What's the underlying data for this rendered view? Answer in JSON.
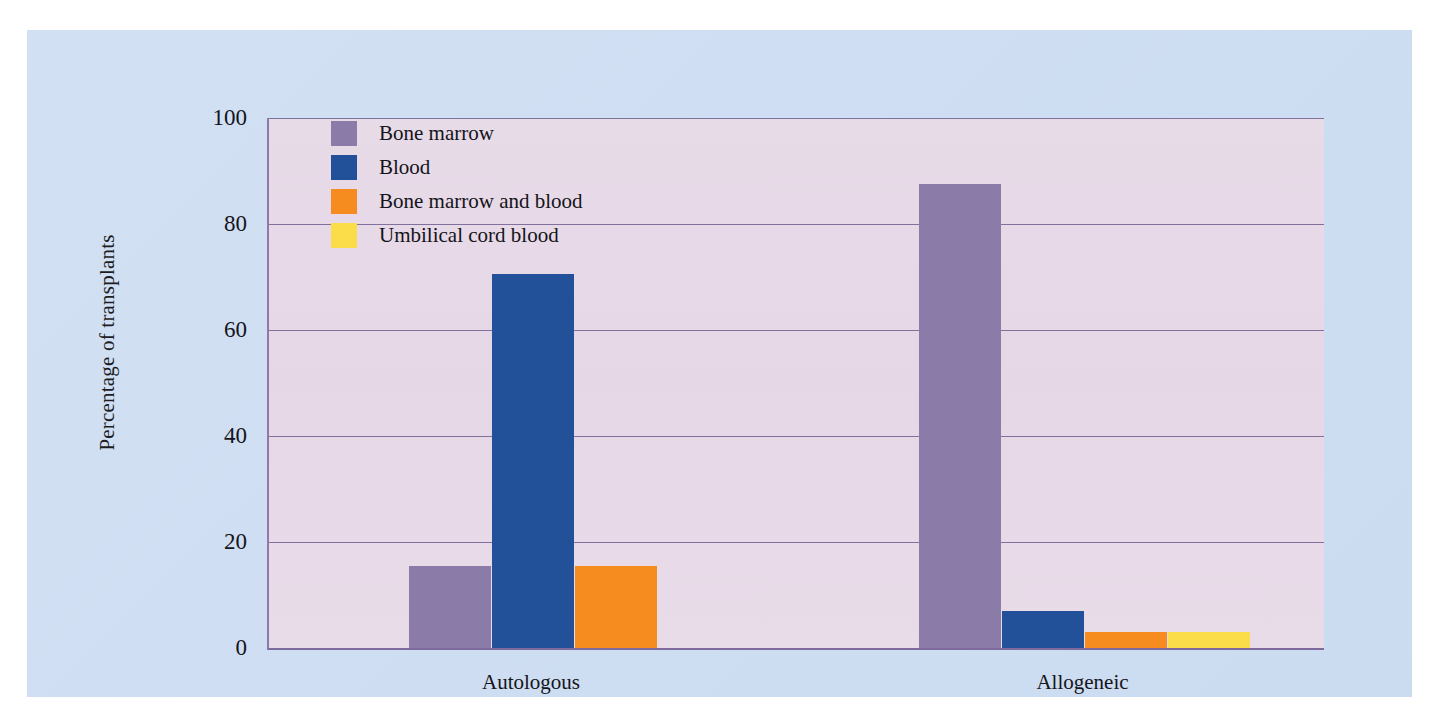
{
  "figure": {
    "background_color": "#ffffff",
    "panel_color": "#cfdef2",
    "plot_background_color": "#e7d9e7",
    "axis_color": "#7c6b9c",
    "gridline_color": "#6f5f8f"
  },
  "chart_data": {
    "type": "bar",
    "title": "",
    "xlabel": "",
    "ylabel": "Percentage of transplants",
    "categories": [
      "Autologous",
      "Allogeneic"
    ],
    "ylim": [
      0,
      100
    ],
    "yticks": [
      0,
      20,
      40,
      60,
      80,
      100
    ],
    "ytick_labels": [
      "0",
      "20",
      "40",
      "60",
      "80",
      "100"
    ],
    "grid": true,
    "legend_position": "upper left",
    "series": [
      {
        "name": "Bone marrow",
        "color": "#8a7ba8",
        "values": [
          15.5,
          87.5
        ]
      },
      {
        "name": "Blood",
        "color": "#22519a",
        "values": [
          70.5,
          7
        ]
      },
      {
        "name": "Bone marrow and blood",
        "color": "#f68b1f",
        "values": [
          15.5,
          3
        ]
      },
      {
        "name": "Umbilical cord blood",
        "color": "#fbdc49",
        "values": [
          0,
          3
        ]
      }
    ]
  }
}
